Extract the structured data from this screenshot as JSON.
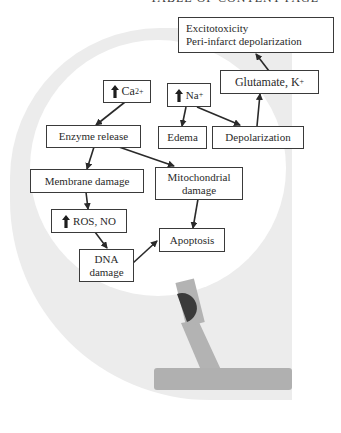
{
  "page": {
    "header_fragment": "TABLE OF CONTENT PAGE"
  },
  "diagram": {
    "nodes": {
      "excitotoxicity": {
        "line1": "Excitotoxicity",
        "line2": "Peri-infarct depolarization"
      },
      "glutamate": {
        "label": "Glutamate, K",
        "sup": "+"
      },
      "calcium": {
        "label": "Ca",
        "sup": "2+",
        "icon": "up-arrow-icon"
      },
      "sodium": {
        "label": "Na",
        "sup": "+",
        "icon": "up-arrow-icon"
      },
      "enzyme_release": {
        "label": "Enzyme release"
      },
      "edema": {
        "label": "Edema"
      },
      "depolarization": {
        "label": "Depolarization"
      },
      "membrane_damage": {
        "label": "Membrane damage"
      },
      "mitochondrial_damage": {
        "line1": "Mitochondrial",
        "line2": "damage"
      },
      "ros_no": {
        "label": "ROS, NO",
        "icon": "up-arrow-icon"
      },
      "apoptosis": {
        "label": "Apoptosis"
      },
      "dna_damage": {
        "line1": "DNA",
        "line2": "damage"
      }
    },
    "edges": [
      {
        "from": "calcium",
        "to": "enzyme_release"
      },
      {
        "from": "sodium",
        "to": "edema"
      },
      {
        "from": "sodium",
        "to": "depolarization"
      },
      {
        "from": "depolarization",
        "to": "glutamate"
      },
      {
        "from": "glutamate",
        "to": "excitotoxicity"
      },
      {
        "from": "enzyme_release",
        "to": "membrane_damage"
      },
      {
        "from": "enzyme_release",
        "to": "mitochondrial_damage"
      },
      {
        "from": "membrane_damage",
        "to": "ros_no"
      },
      {
        "from": "ros_no",
        "to": "dna_damage"
      },
      {
        "from": "mitochondrial_damage",
        "to": "apoptosis"
      },
      {
        "from": "dna_damage",
        "to": "apoptosis"
      }
    ],
    "colors": {
      "background_shape": "#ededed",
      "inner_circle": "#ffffff",
      "stand": "#b4b4b4",
      "stand_knob": "#3c3c3c",
      "stroke": "#2a2a2a"
    }
  }
}
